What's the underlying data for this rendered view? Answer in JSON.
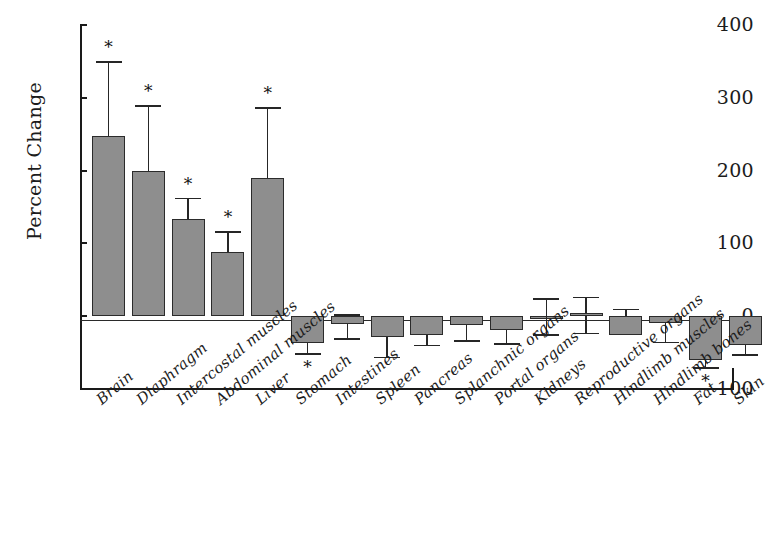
{
  "chart_data": {
    "type": "bar",
    "title": "",
    "xlabel": "",
    "ylabel": "Percent Change",
    "ylim": [
      -100,
      400
    ],
    "yticks": [
      -100,
      0,
      100,
      200,
      300,
      400
    ],
    "ytick_labels": [
      "- 100",
      "0",
      "100",
      "200",
      "300",
      "400"
    ],
    "grid": false,
    "legend": "none",
    "annotation_marker": "*",
    "annotation_note": "* denotes statistically significant change",
    "categories": [
      "Brain",
      "Diaphragm",
      "Intercostal muscles",
      "Abdominal muscles",
      "Liver",
      "Stomach",
      "Intestines",
      "Spleen",
      "Pancreas",
      "Splanchnic organs",
      "Portal organs",
      "Kidneys",
      "Reproductive organs",
      "Hindlimb muscles",
      "Hindlimb bones",
      "Fat",
      "Skin"
    ],
    "values": [
      247,
      200,
      133,
      88,
      190,
      -37,
      -11,
      -29,
      -26,
      -12,
      -19,
      0,
      4,
      -26,
      -10,
      -60,
      -40
    ],
    "err_upper": [
      350,
      290,
      163,
      117,
      287,
      -22,
      3,
      -8,
      -9,
      0,
      0,
      25,
      27,
      10,
      0,
      -37,
      -23
    ],
    "err_lower": [
      247,
      200,
      133,
      88,
      190,
      -51,
      -30,
      -56,
      -39,
      -33,
      -37,
      -25,
      -23,
      -23,
      -35,
      -70,
      -52
    ],
    "significant": [
      true,
      true,
      true,
      true,
      true,
      true,
      false,
      false,
      false,
      false,
      false,
      false,
      false,
      false,
      false,
      true,
      false
    ],
    "bar_color": "#8e8e8e",
    "bar_edge_color": "#2b2b2b",
    "axis_color": "#1a1a1a"
  },
  "axis": {
    "y_title": "Percent Change"
  }
}
